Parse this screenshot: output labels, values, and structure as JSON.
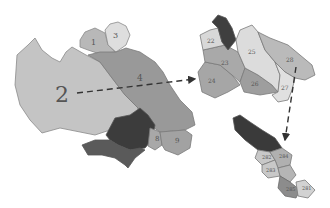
{
  "diagram": {
    "colors": {
      "light": "#c9c9c9",
      "lighter": "#dcdcdc",
      "mid": "#9d9d9d",
      "midlight": "#b3b3b3",
      "dark": "#3f3f3f",
      "darkmid": "#5e5e5e",
      "edge": "#7a7a7a",
      "arrow": "#333333"
    },
    "main_basin": {
      "labels": {
        "big": "2",
        "l1": "1",
        "l3": "3",
        "l4": "4",
        "l8": "8",
        "l9": "9"
      }
    },
    "level2_basin": {
      "labels": {
        "l22": "22",
        "l23": "23",
        "l24": "24",
        "l25": "25",
        "l26": "26",
        "l27": "27",
        "l28": "28",
        "l21": "21"
      }
    },
    "level3_basin": {
      "labels": {
        "l281": "281",
        "l282": "282",
        "l283": "283",
        "l284": "284",
        "l285": "285"
      }
    }
  }
}
